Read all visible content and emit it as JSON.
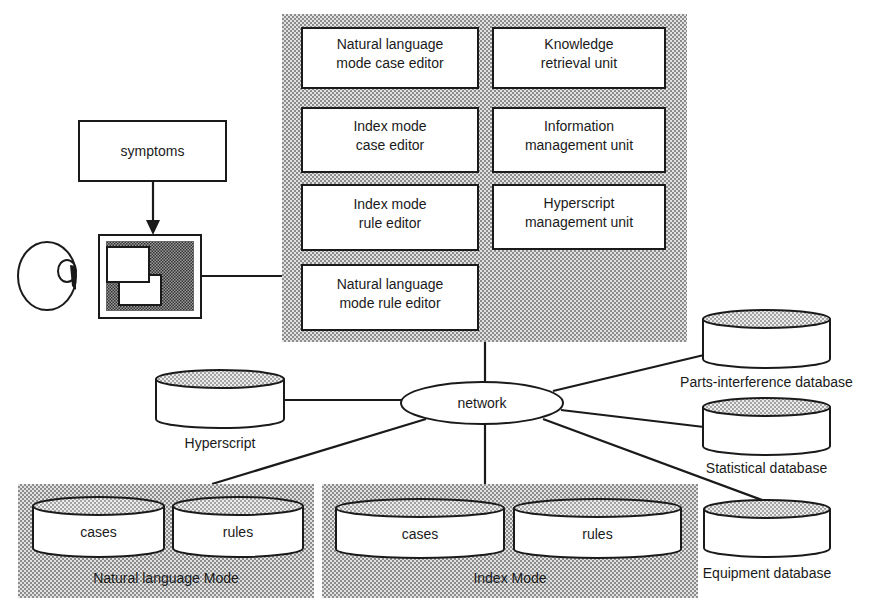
{
  "diagram": {
    "system_panel": {
      "units": [
        {
          "id": "nl-case-editor",
          "lines": [
            "Natural language",
            "mode case editor"
          ]
        },
        {
          "id": "knowledge-retrieval",
          "lines": [
            "Knowledge",
            "retrieval unit"
          ]
        },
        {
          "id": "index-case-editor",
          "lines": [
            "Index mode",
            "case editor"
          ]
        },
        {
          "id": "information-management",
          "lines": [
            "Information",
            "management unit"
          ]
        },
        {
          "id": "index-rule-editor",
          "lines": [
            "Index mode",
            "rule editor"
          ]
        },
        {
          "id": "hyperscript-management",
          "lines": [
            "Hyperscript",
            "management unit"
          ]
        },
        {
          "id": "nl-rule-editor",
          "lines": [
            "Natural language",
            "mode rule editor"
          ]
        }
      ]
    },
    "symptoms_label": "symptoms",
    "network_label": "network",
    "databases": {
      "hyperscript": "Hyperscript",
      "parts_interference": "Parts-interference database",
      "statistical": "Statistical database",
      "equipment": "Equipment database"
    },
    "mode_groups": {
      "natural_language": {
        "label": "Natural language Mode",
        "stores": [
          "cases",
          "rules"
        ]
      },
      "index": {
        "label": "Index Mode",
        "stores": [
          "cases",
          "rules"
        ]
      }
    },
    "icons": {
      "user": "user-head-icon",
      "terminal": "terminal-screen-icon"
    },
    "colors": {
      "ink": "#1a1a1a",
      "pattern_dark": "#8a8a8a",
      "pattern_light": "#d4d4d4",
      "background": "#ffffff"
    }
  }
}
